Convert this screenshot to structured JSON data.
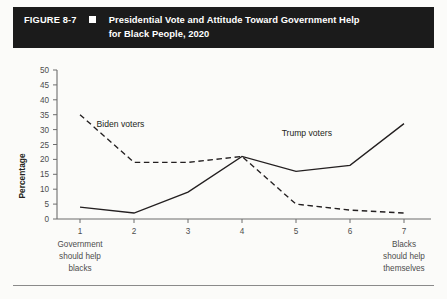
{
  "figure": {
    "number": "FIGURE 8-7",
    "marker_icon": "white-square-icon",
    "title": "Presidential Vote and Attitude Toward Government Help for Black People, 2020",
    "title_line1": "Presidential Vote and Attitude Toward Government Help",
    "title_line2": "for Black People, 2020",
    "header_bg": "#1b1b1b",
    "header_fg": "#ffffff"
  },
  "chart_data": {
    "type": "line",
    "title": "Presidential Vote and Attitude Toward Government Help for Black People, 2020",
    "xlabel": "",
    "ylabel": "Percentage",
    "x": [
      1,
      2,
      3,
      4,
      5,
      6,
      7
    ],
    "categories": [
      "1",
      "2",
      "3",
      "4",
      "5",
      "6",
      "7"
    ],
    "xlim": [
      1,
      7
    ],
    "ylim": [
      0,
      50
    ],
    "yticks": [
      0,
      5,
      10,
      15,
      20,
      25,
      30,
      35,
      40,
      45,
      50
    ],
    "ytick_labels": [
      "0",
      "5",
      "10",
      "15",
      "20",
      "25",
      "30",
      "35",
      "40",
      "45",
      "50"
    ],
    "grid": false,
    "legend_position": "inline-annotation",
    "series": [
      {
        "name": "Biden voters",
        "style": "dashed",
        "color": "#231f20",
        "values": [
          35,
          19,
          19,
          21,
          5,
          3,
          2
        ]
      },
      {
        "name": "Trump voters",
        "style": "solid",
        "color": "#231f20",
        "values": [
          4,
          2,
          9,
          21,
          16,
          18,
          32
        ]
      }
    ],
    "annotations": [
      {
        "text": "Biden voters",
        "series": "Biden voters",
        "x": 1.75,
        "y": 31
      },
      {
        "text": "Trump voters",
        "series": "Trump voters",
        "x": 5.2,
        "y": 28
      }
    ],
    "axis_anchor_left": {
      "line1": "Government",
      "line2": "should help",
      "line3": "blacks"
    },
    "axis_anchor_right": {
      "line1": "Blacks",
      "line2": "should help",
      "line3": "themselves"
    }
  }
}
